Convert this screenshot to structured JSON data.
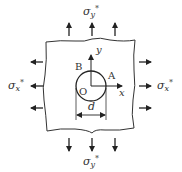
{
  "diagram": {
    "colors": {
      "line": "#333333",
      "background": "#ffffff"
    },
    "labels": {
      "sigma_y_top": {
        "symbol": "σ",
        "sub": "y",
        "sup": "*"
      },
      "sigma_y_bottom": {
        "symbol": "σ",
        "sub": "y",
        "sup": "*"
      },
      "sigma_x_left": {
        "symbol": "σ",
        "sub": "x",
        "sup": "*"
      },
      "sigma_x_right": {
        "symbol": "σ",
        "sub": "x",
        "sup": "*"
      },
      "point_A": "A",
      "point_B": "B",
      "origin": "O",
      "axis_x": "x",
      "axis_y": "y",
      "diameter": "d"
    },
    "arrows": {
      "top_count": 3,
      "bottom_count": 3,
      "left_count": 3,
      "right_count": 3
    }
  }
}
